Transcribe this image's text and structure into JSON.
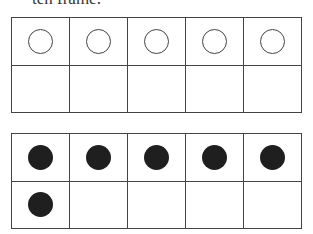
{
  "caption": "ten frame.",
  "frames": [
    {
      "name": "ten-frame-empty-counters",
      "cells": [
        "empty",
        "empty",
        "empty",
        "empty",
        "empty",
        "none",
        "none",
        "none",
        "none",
        "none"
      ]
    },
    {
      "name": "ten-frame-six-filled",
      "cells": [
        "filled",
        "filled",
        "filled",
        "filled",
        "filled",
        "filled",
        "none",
        "none",
        "none",
        "none"
      ]
    }
  ]
}
